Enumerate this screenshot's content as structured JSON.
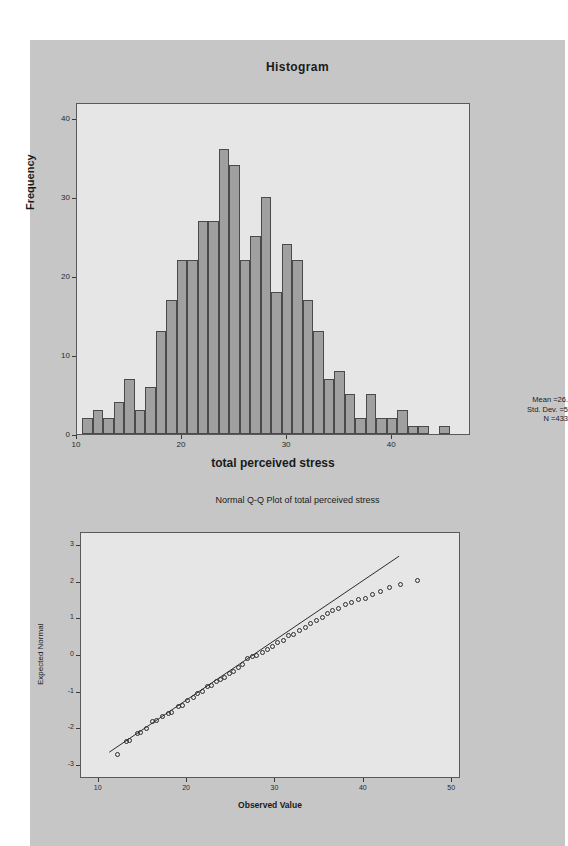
{
  "page": {
    "background_color": "#ffffff",
    "panel_color": "#c6c6c6",
    "plot_area_color": "#e6e6e6",
    "bar_fill_color": "#a0a0a0",
    "bar_border_color": "#4a4a4a"
  },
  "chart_data": [
    {
      "type": "bar",
      "id": "histogram",
      "title": "Histogram",
      "xlabel": "total perceived stress",
      "ylabel": "Frequency",
      "xlim": [
        10,
        47.5
      ],
      "ylim": [
        0,
        42
      ],
      "xticks": [
        "10",
        "20",
        "30",
        "40"
      ],
      "xtick_values": [
        10,
        20,
        30,
        40
      ],
      "yticks": [
        "0",
        "10",
        "20",
        "30",
        "40"
      ],
      "ytick_values": [
        0,
        10,
        20,
        30,
        40
      ],
      "grid": false,
      "bin_width": 1,
      "categories": [
        11,
        12,
        13,
        14,
        15,
        16,
        17,
        18,
        19,
        20,
        21,
        22,
        23,
        24,
        25,
        26,
        27,
        28,
        29,
        30,
        31,
        32,
        33,
        34,
        35,
        36,
        37,
        38,
        39,
        40,
        41,
        42,
        43,
        44,
        45,
        46
      ],
      "values": [
        2,
        3,
        2,
        4,
        7,
        3,
        6,
        13,
        17,
        22,
        22,
        27,
        27,
        36,
        34,
        22,
        25,
        30,
        18,
        24,
        22,
        17,
        13,
        7,
        8,
        5,
        2,
        5,
        2,
        2,
        3,
        1,
        1,
        0,
        1,
        0
      ],
      "annotations": {
        "mean_label": "Mean =26.",
        "std_dev_label": "Std. Dev. =5",
        "n_label": "N =433",
        "note": "statistics text is clipped at the right edge of the screenshot"
      }
    },
    {
      "type": "scatter",
      "id": "qq-plot",
      "title": "Normal Q-Q Plot of total perceived stress",
      "xlabel": "Observed Value",
      "ylabel": "Expected Normal",
      "xlim": [
        8,
        51
      ],
      "ylim": [
        -3.35,
        3.35
      ],
      "xticks": [
        "10",
        "20",
        "30",
        "40",
        "50"
      ],
      "xtick_values": [
        10,
        20,
        30,
        40,
        50
      ],
      "yticks": [
        "-3",
        "-2",
        "-1",
        "0",
        "1",
        "2",
        "3"
      ],
      "ytick_values": [
        -3,
        -2,
        -1,
        0,
        1,
        2,
        3
      ],
      "grid": false,
      "reference_line": {
        "x1": 11.2,
        "y1": -2.62,
        "x2": 44.0,
        "y2": 2.72
      },
      "x": [
        12.2,
        13.3,
        13.6,
        14.5,
        14.9,
        15.5,
        16.2,
        16.6,
        17.3,
        18.0,
        18.4,
        19.1,
        19.6,
        20.2,
        20.8,
        21.3,
        21.9,
        22.4,
        22.9,
        23.4,
        23.9,
        24.4,
        24.9,
        25.4,
        25.9,
        26.4,
        26.9,
        27.5,
        28.0,
        28.6,
        29.2,
        29.8,
        30.4,
        31.0,
        31.6,
        32.2,
        32.8,
        33.5,
        34.1,
        34.8,
        35.4,
        36.0,
        36.6,
        37.3,
        38.0,
        38.7,
        39.5,
        40.3,
        41.1,
        42.0,
        43.0,
        44.3,
        46.2
      ],
      "y": [
        -2.7,
        -2.35,
        -2.33,
        -2.14,
        -2.1,
        -2.0,
        -1.82,
        -1.78,
        -1.68,
        -1.6,
        -1.56,
        -1.41,
        -1.38,
        -1.24,
        -1.17,
        -1.04,
        -1.0,
        -0.87,
        -0.83,
        -0.73,
        -0.66,
        -0.62,
        -0.5,
        -0.44,
        -0.33,
        -0.27,
        -0.1,
        -0.03,
        0.0,
        0.08,
        0.14,
        0.23,
        0.33,
        0.4,
        0.52,
        0.57,
        0.67,
        0.75,
        0.85,
        0.95,
        1.03,
        1.12,
        1.2,
        1.28,
        1.38,
        1.42,
        1.5,
        1.55,
        1.65,
        1.73,
        1.83,
        1.93,
        2.02,
        2.12,
        2.22,
        2.32,
        2.42,
        2.53,
        2.77
      ]
    }
  ],
  "histogram": {
    "title": "Histogram",
    "xlabel": "total perceived stress",
    "ylabel": "Frequency",
    "stats": {
      "mean": "Mean =26.",
      "std_dev": "Std. Dev. =5",
      "n": "N =433"
    }
  },
  "qq": {
    "title": "Normal Q-Q Plot of total perceived stress",
    "xlabel": "Observed Value",
    "ylabel": "Expected Normal"
  }
}
